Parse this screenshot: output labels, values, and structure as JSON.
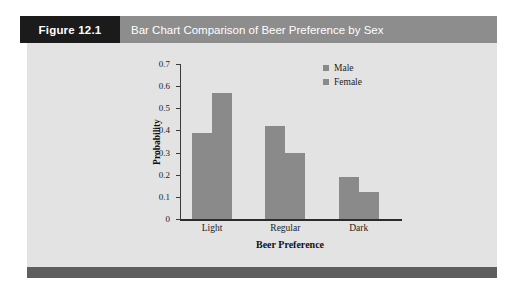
{
  "figure": {
    "number_label": "Figure 12.1",
    "title": "Bar Chart Comparison of Beer Preference by Sex",
    "number_block_color": "#1b1b1b",
    "title_block_color": "#8d8d8d",
    "panel_color": "#e3e3e3",
    "footer_bar_color": "#5e5e5e"
  },
  "chart_data": {
    "type": "bar",
    "title": "",
    "categories": [
      "Light",
      "Regular",
      "Dark"
    ],
    "series": [
      {
        "name": "Male",
        "values": [
          0.39,
          0.42,
          0.19
        ],
        "color": "#8a8a8a"
      },
      {
        "name": "Female",
        "values": [
          0.57,
          0.3,
          0.12
        ],
        "color": "#8a8a8a"
      }
    ],
    "xlabel": "Beer Preference",
    "ylabel": "Probability",
    "ylim": [
      0,
      0.7
    ],
    "yticks": [
      "0.7",
      "0.6",
      "0.5",
      "0.4",
      "0.3",
      "0.2",
      "0.1",
      "0"
    ],
    "ytick_values": [
      0.7,
      0.6,
      0.5,
      0.4,
      0.3,
      0.2,
      0.1,
      0
    ],
    "grid": false,
    "legend_position": "top-right",
    "legend": [
      "Male",
      "Female"
    ],
    "bar_color": "#8a8a8a"
  }
}
